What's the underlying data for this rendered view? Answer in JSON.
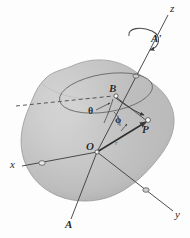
{
  "figure": {
    "type": "diagram",
    "background_color": "#fdfdfd",
    "body": {
      "name": "rigid body blob",
      "fill_color": "#c6c6c6",
      "highlight_color": "#d8d8d8",
      "shadow_color": "#a9a9a9",
      "outline_color": "#8e8e8e"
    },
    "axes": [
      {
        "id": "z",
        "label": "z",
        "x": 172,
        "y": 9,
        "from": [
          97,
          152
        ],
        "to": [
          168,
          16
        ]
      },
      {
        "id": "x",
        "label": "x",
        "x": 12,
        "y": 163,
        "from": [
          97,
          152
        ],
        "to": [
          22,
          167
        ]
      },
      {
        "id": "y",
        "label": "y",
        "x": 176,
        "y": 213,
        "from": [
          97,
          152
        ],
        "to": [
          172,
          210
        ]
      },
      {
        "id": "A",
        "label": "A",
        "x": 66,
        "y": 222,
        "from": [
          97,
          152
        ],
        "to": [
          72,
          218
        ]
      },
      {
        "id": "A-prime",
        "label": "A'",
        "x": 152,
        "y": 37,
        "from": null,
        "to": null
      }
    ],
    "points": [
      {
        "id": "O",
        "label": "O",
        "x": 88,
        "y": 144,
        "desc": "origin"
      },
      {
        "id": "B",
        "label": "B",
        "x": 110,
        "y": 86,
        "desc": "point-on-axis"
      },
      {
        "id": "P",
        "label": "P",
        "x": 143,
        "y": 126,
        "desc": "particle-point"
      }
    ],
    "angles": [
      {
        "id": "theta",
        "label": "θ",
        "x": 89,
        "y": 108,
        "desc": "polar-angle"
      },
      {
        "id": "phi",
        "label": "ϕ",
        "x": 116,
        "y": 117,
        "desc": "azimuthal-angle"
      }
    ],
    "vectors": [
      {
        "id": "r",
        "label": "r",
        "x": 115,
        "y": 142,
        "from": [
          97,
          152
        ],
        "to": [
          146,
          121
        ],
        "desc": "position-vector-O-to-P"
      }
    ],
    "markers": [
      {
        "id": "x-axis-tick",
        "x": 42,
        "y": 163
      },
      {
        "id": "y-axis-tick",
        "x": 146,
        "y": 190
      },
      {
        "id": "z-axis-tick",
        "x": 136,
        "y": 76
      }
    ],
    "ellipse": {
      "id": "circle-of-rotation",
      "cx": 106,
      "cy": 93,
      "rx": 47,
      "ry": 19,
      "rotation_deg": -9,
      "stroke_color": "#6b6b6b",
      "desc": "circular path traced by P about axis AA'"
    },
    "rotation_arrow": {
      "id": "spin-arrow",
      "cx": 142,
      "cy": 40,
      "desc": "curved arrow showing spin about axis A-A-prime"
    },
    "dashed_line": {
      "id": "reference-dashed-line",
      "from": [
        16,
        106
      ],
      "to": [
        113,
        96
      ],
      "stroke_color": "#4a4a4a",
      "desc": "dashed reference line through body"
    }
  }
}
